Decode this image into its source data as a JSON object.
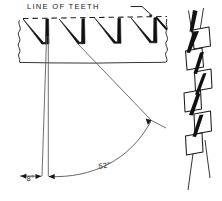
{
  "figure": {
    "type": "engineering-diagram",
    "background": "#ffffff",
    "ink_color": "#111111",
    "width": 222,
    "height": 201
  },
  "annotations": {
    "line_of_teeth_label": "LINE  OF  TEETH",
    "hook_angle_label": "8°",
    "back_angle_label": "52°"
  },
  "side_view": {
    "name": "tooth-profile-side-view",
    "tooth_count": 4,
    "dashed_line_name": "line-of-teeth-dashed",
    "break_edges": [
      "left-break-line",
      "right-break-line"
    ],
    "body_bottom_name": "blade-body-bottom-edge"
  },
  "angles": {
    "hook": {
      "value": "8°",
      "name": "hook-angle"
    },
    "back": {
      "value": "52°",
      "name": "back-angle"
    }
  },
  "top_view": {
    "name": "tooth-set-top-view",
    "tooth_blocks": 5,
    "description": "alternating set teeth"
  }
}
